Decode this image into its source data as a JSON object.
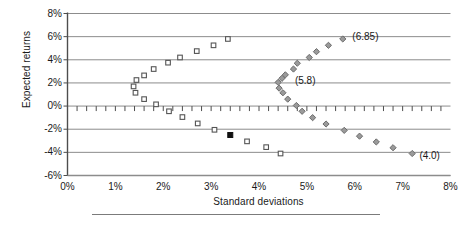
{
  "chart_data": {
    "type": "scatter",
    "title": "",
    "xlabel": "Standard deviations",
    "ylabel": "Expected returns",
    "xlim": [
      0,
      8
    ],
    "ylim": [
      -6,
      8
    ],
    "x_ticks": [
      "0%",
      "1%",
      "2%",
      "3%",
      "4%",
      "5%",
      "6%",
      "7%",
      "8%"
    ],
    "x_tick_values": [
      0,
      1,
      2,
      3,
      4,
      5,
      6,
      7,
      8
    ],
    "y_ticks": [
      "8%",
      "6%",
      "4%",
      "2%",
      "0%",
      "-2%",
      "-4%",
      "-6%"
    ],
    "y_tick_values": [
      8,
      6,
      4,
      2,
      0,
      -2,
      -4,
      -6
    ],
    "grid": "horizontal",
    "minor_ticks_on_zero_axis": true,
    "minor_tick_step": 0.2,
    "legend": "none",
    "series": [
      {
        "name": "open-square-frontier",
        "marker": "open-square",
        "color": "#555555",
        "points": [
          [
            1.38,
            1.7
          ],
          [
            1.42,
            1.15
          ],
          [
            1.44,
            2.25
          ],
          [
            1.6,
            2.65
          ],
          [
            1.6,
            0.6
          ],
          [
            1.8,
            3.2
          ],
          [
            1.85,
            0.15
          ],
          [
            2.1,
            3.75
          ],
          [
            2.12,
            -0.45
          ],
          [
            2.35,
            4.2
          ],
          [
            2.4,
            -0.95
          ],
          [
            2.7,
            4.75
          ],
          [
            2.72,
            -1.5
          ],
          [
            3.05,
            5.25
          ],
          [
            3.07,
            -2.05
          ],
          [
            3.35,
            5.8
          ],
          [
            3.75,
            -3.05
          ],
          [
            4.15,
            -3.55
          ],
          [
            4.45,
            -4.1
          ]
        ]
      },
      {
        "name": "highlighted-point",
        "marker": "filled-square",
        "color": "#111111",
        "points": [
          [
            3.4,
            -2.5
          ]
        ]
      },
      {
        "name": "diamond-frontier",
        "marker": "filled-diamond",
        "color": "#6b6b6b",
        "points": [
          [
            4.4,
            2.05
          ],
          [
            4.42,
            1.55
          ],
          [
            4.48,
            2.4
          ],
          [
            4.5,
            1.15
          ],
          [
            4.55,
            2.7
          ],
          [
            4.6,
            0.6
          ],
          [
            4.72,
            3.2
          ],
          [
            4.78,
            0.05
          ],
          [
            4.8,
            3.7
          ],
          [
            4.9,
            -0.45
          ],
          [
            5.05,
            4.2
          ],
          [
            5.12,
            -1.0
          ],
          [
            5.2,
            4.7
          ],
          [
            5.4,
            -1.55
          ],
          [
            5.45,
            5.25
          ],
          [
            5.75,
            5.8
          ],
          [
            5.78,
            -2.1
          ],
          [
            6.1,
            -2.6
          ],
          [
            6.45,
            -3.1
          ],
          [
            6.8,
            -3.6
          ],
          [
            7.2,
            -4.1
          ]
        ]
      }
    ],
    "annotations": [
      {
        "text": "(6.85)",
        "x": 5.95,
        "y": 5.95
      },
      {
        "text": "(5.8)",
        "x": 4.75,
        "y": 2.2
      },
      {
        "text": "(4.0)",
        "x": 7.35,
        "y": -4.35
      }
    ],
    "colors": {
      "gridline": "#8c8c8c",
      "axis": "#4d4d4d",
      "open_square": "#555555",
      "filled_square": "#111111",
      "diamond": "#6b6b6b",
      "background": "#ffffff",
      "text": "#1a1a1a"
    }
  }
}
